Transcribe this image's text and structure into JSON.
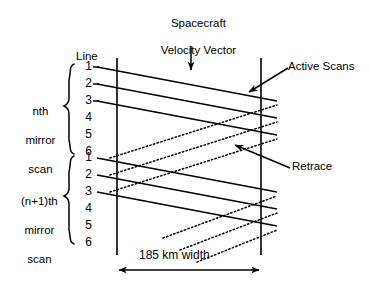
{
  "figure": {
    "title_line1": "Spacecraft",
    "title_line2": "Velocity Vector",
    "line_header": "Line",
    "width_label": "185 km width",
    "callouts": {
      "active_scans": "Active Scans",
      "retrace": "Retrace"
    },
    "groups": [
      {
        "label_line1": "nth",
        "label_line2": "mirror",
        "label_line3": "scan",
        "line_numbers": [
          "1",
          "2",
          "3",
          "4",
          "5",
          "6"
        ]
      },
      {
        "label_line1": "(n+1)th",
        "label_line2": "mirror",
        "label_line3": "scan",
        "line_numbers": [
          "1",
          "2",
          "3",
          "4",
          "5",
          "6"
        ]
      }
    ],
    "colors": {
      "ink": "#000000",
      "paper": "#ffffff"
    },
    "icon_names": {
      "velocity_arrow": "down-arrow-icon",
      "active_scans_arrow": "pointer-arrow-icon",
      "retrace_arrow": "pointer-arrow-icon",
      "width_arrow": "double-headed-arrow-icon"
    }
  }
}
